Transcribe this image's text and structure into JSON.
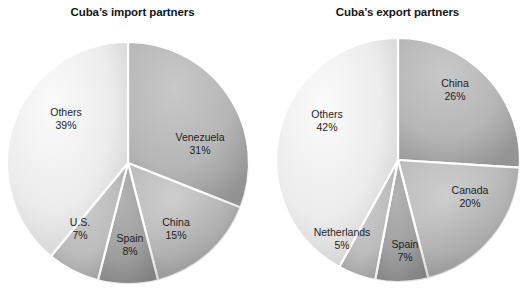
{
  "charts": [
    {
      "id": "import",
      "title": "Cuba’s import partners",
      "slices": [
        {
          "label": "Venezuela",
          "pct": "31%",
          "value": 31,
          "fill": "#b0b0b0",
          "lx": 200,
          "ly": 143
        },
        {
          "label": "China",
          "pct": "15%",
          "value": 15,
          "fill": "#b8b8b8",
          "lx": 176,
          "ly": 228
        },
        {
          "label": "Spain",
          "pct": "8%",
          "value": 8,
          "fill": "#9e9e9e",
          "lx": 130,
          "ly": 244
        },
        {
          "label": "U.S.",
          "pct": "7%",
          "value": 7,
          "fill": "#b5b5b5",
          "lx": 80,
          "ly": 228
        },
        {
          "label": "Others",
          "pct": "39%",
          "value": 39,
          "fill": "#e6e6e6",
          "lx": 66,
          "ly": 118
        }
      ]
    },
    {
      "id": "export",
      "title": "Cuba’s export partners",
      "slices": [
        {
          "label": "China",
          "pct": "26%",
          "value": 26,
          "fill": "#b0b0b0",
          "lx": 455,
          "ly": 89
        },
        {
          "label": "Canada",
          "pct": "20%",
          "value": 20,
          "fill": "#b8b8b8",
          "lx": 470,
          "ly": 196
        },
        {
          "label": "Spain",
          "pct": "7%",
          "value": 7,
          "fill": "#9e9e9e",
          "lx": 405,
          "ly": 250
        },
        {
          "label": "Netherlands",
          "pct": "5%",
          "value": 5,
          "fill": "#bdbdbd",
          "lx": 342,
          "ly": 238
        },
        {
          "label": "Others",
          "pct": "42%",
          "value": 42,
          "fill": "#e6e6e6",
          "lx": 327,
          "ly": 120
        }
      ]
    }
  ],
  "chart_data": [
    {
      "type": "pie",
      "title": "Cuba’s import partners",
      "categories": [
        "Venezuela",
        "China",
        "Spain",
        "U.S.",
        "Others"
      ],
      "values": [
        31,
        15,
        8,
        7,
        39
      ],
      "unit": "percent",
      "labels": [
        "31%",
        "15%",
        "8%",
        "7%",
        "39%"
      ],
      "legend": "none (labels drawn on slices)",
      "start_angle_deg": 0,
      "direction": "clockwise"
    },
    {
      "type": "pie",
      "title": "Cuba’s export partners",
      "categories": [
        "China",
        "Canada",
        "Spain",
        "Netherlands",
        "Others"
      ],
      "values": [
        26,
        20,
        7,
        5,
        42
      ],
      "unit": "percent",
      "labels": [
        "26%",
        "20%",
        "7%",
        "5%",
        "42%"
      ],
      "legend": "none (labels drawn on slices)",
      "start_angle_deg": 0,
      "direction": "clockwise"
    }
  ],
  "geometry": {
    "import": {
      "cx": 128,
      "cy": 163,
      "r": 121
    },
    "export": {
      "cx": 398,
      "cy": 160,
      "r": 122
    }
  }
}
